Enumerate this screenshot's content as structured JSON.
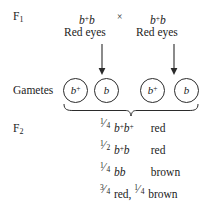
{
  "figure": {
    "type": "genetic-cross-diagram",
    "ink_color": "#1b1b1b",
    "background_color": "#ffffff"
  },
  "rows": {
    "f1": {
      "label": "F",
      "subscript": "1"
    },
    "gametes": {
      "label": "Gametes"
    },
    "f2": {
      "label": "F",
      "subscript": "2"
    }
  },
  "f1_cross": {
    "parent_left": {
      "allele_1": "b",
      "allele_1_superscript": "+",
      "allele_2": "b",
      "phenotype": "Red eyes"
    },
    "cross_symbol": "×",
    "parent_right": {
      "allele_1": "b",
      "allele_1_superscript": "+",
      "allele_2": "b",
      "phenotype": "Red eyes"
    }
  },
  "gametes": [
    {
      "allele": "b",
      "superscript": "+",
      "parent": "left"
    },
    {
      "allele": "b",
      "superscript": "",
      "parent": "left"
    },
    {
      "allele": "b",
      "superscript": "+",
      "parent": "right"
    },
    {
      "allele": "b",
      "superscript": "",
      "parent": "right"
    }
  ],
  "f2_results": [
    {
      "fraction_numerator": "1",
      "fraction_solidus": "⁄",
      "fraction_denominator": "4",
      "genotype_allele_1": "b",
      "genotype_sup_1": "+",
      "genotype_allele_2": "b",
      "genotype_sup_2": "+",
      "phenotype": "red"
    },
    {
      "fraction_numerator": "1",
      "fraction_solidus": "⁄",
      "fraction_denominator": "2",
      "genotype_allele_1": "b",
      "genotype_sup_1": "+",
      "genotype_allele_2": "b",
      "genotype_sup_2": "",
      "phenotype": "red"
    },
    {
      "fraction_numerator": "1",
      "fraction_solidus": "⁄",
      "fraction_denominator": "4",
      "genotype_allele_1": "b",
      "genotype_sup_1": "",
      "genotype_allele_2": "b",
      "genotype_sup_2": "",
      "phenotype": "brown"
    }
  ],
  "f2_summary": {
    "first_numerator": "3",
    "first_solidus": "⁄",
    "first_denominator": "4",
    "first_phenotype": "red,",
    "second_numerator": "1",
    "second_solidus": "⁄",
    "second_denominator": "4",
    "second_phenotype": "brown"
  },
  "connectors": {
    "arrow_left": "down-arrow",
    "arrow_right": "down-arrow",
    "brace": "horizontal-curly-brace-down"
  }
}
